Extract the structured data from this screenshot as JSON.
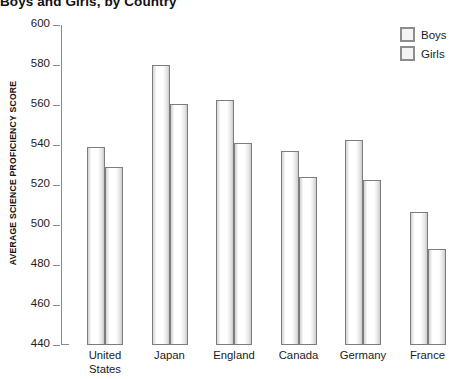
{
  "chart_data": {
    "type": "bar",
    "title": "Boys and Girls, by Country",
    "xlabel": "",
    "ylabel": "AVERAGE SCIENCE PROFICIENCY SCORE",
    "ylim": [
      440,
      600
    ],
    "ytick_step": 20,
    "yticks": [
      600,
      580,
      560,
      540,
      520,
      500,
      480,
      460,
      440
    ],
    "ytick_labels": [
      "600",
      "580",
      "560",
      "540",
      "520",
      "500",
      "480",
      "460",
      "440"
    ],
    "grid": false,
    "legend_position": "top-right",
    "categories": [
      "United States",
      "Japan",
      "England",
      "Canada",
      "Germany",
      "France"
    ],
    "category_lines": [
      [
        "United",
        "States"
      ],
      [
        "Japan"
      ],
      [
        "England"
      ],
      [
        "Canada"
      ],
      [
        "Germany"
      ],
      [
        "France"
      ]
    ],
    "series": [
      {
        "name": "Boys",
        "values": [
          539,
          580,
          562.5,
          537,
          542.5,
          506.5
        ]
      },
      {
        "name": "Girls",
        "values": [
          529,
          560.5,
          541,
          524,
          522.5,
          488
        ]
      }
    ]
  },
  "legend": {
    "items": [
      {
        "label": "Boys"
      },
      {
        "label": "Girls"
      }
    ]
  },
  "colors": {
    "bar_border": "#7d7d7d",
    "bar_fill": "#ffffff",
    "axis": "#8a8a8a",
    "text": "#1a1a1a"
  }
}
